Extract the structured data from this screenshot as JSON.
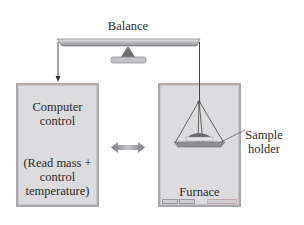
{
  "diagram": {
    "title": "",
    "balance": {
      "label": "Balance"
    },
    "computer": {
      "title_line1": "Computer",
      "title_line2": "control",
      "sub_line1": "(Read mass +",
      "sub_line2": "control",
      "sub_line3": "temperature)"
    },
    "furnace": {
      "label": "Furnace"
    },
    "sample_holder": {
      "label_line1": "Sample",
      "label_line2": "holder"
    },
    "connections": [
      {
        "from": "balance",
        "to": "computer",
        "type": "arrow"
      },
      {
        "from": "balance",
        "to": "sample_holder",
        "type": "wire"
      },
      {
        "from": "computer",
        "to": "furnace",
        "type": "double-arrow"
      }
    ],
    "colors": {
      "box_fill": "#dcdcde",
      "box_border": "#a9a9ad",
      "line": "#444444",
      "arrow_fill": "#8e8e92"
    }
  }
}
